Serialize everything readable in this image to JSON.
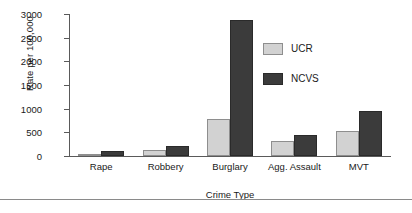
{
  "chart_data": {
    "type": "bar",
    "title": "",
    "xlabel": "Crime Type",
    "ylabel": "Rate per 100,000",
    "categories": [
      "Rape",
      "Robbery",
      "Burglary",
      "Agg. Assault",
      "MVT"
    ],
    "series": [
      {
        "name": "UCR",
        "color": "#d2d2d2",
        "values": [
          40,
          135,
          780,
          320,
          530
        ]
      },
      {
        "name": "NCVS",
        "color": "#3b3b3b",
        "values": [
          105,
          205,
          2870,
          440,
          960
        ]
      }
    ],
    "ylim": [
      0,
      3000
    ],
    "yticks": [
      0,
      500,
      1000,
      1500,
      2000,
      2500,
      3000
    ],
    "ytick_labels": [
      "0",
      "500",
      "1000",
      "1500",
      "2000",
      "2500",
      "3000"
    ],
    "grid": false,
    "legend_position": "upper right",
    "legend_entries": [
      "UCR",
      "NCVS"
    ]
  }
}
